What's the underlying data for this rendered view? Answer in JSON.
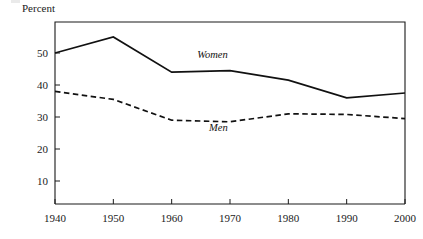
{
  "chart_data": {
    "type": "line",
    "title": "",
    "ylabel": "Percent",
    "xlabel": "",
    "x": [
      1940,
      1950,
      1960,
      1970,
      1980,
      1990,
      2000
    ],
    "xtick_labels": [
      "1940",
      "1950",
      "1960",
      "1970",
      "1980",
      "1990",
      "2000"
    ],
    "ytick_labels": [
      "10",
      "20",
      "30",
      "40",
      "50"
    ],
    "yticks": [
      10,
      20,
      30,
      40,
      50
    ],
    "ylim": [
      0,
      57
    ],
    "xlim": [
      1935,
      2003
    ],
    "grid": false,
    "legend_position": "inline-annotations",
    "series": [
      {
        "name": "Women",
        "style": "solid",
        "color": "#111111",
        "values": [
          50,
          55,
          44,
          44.5,
          41.5,
          36,
          37.5
        ]
      },
      {
        "name": "Men",
        "style": "dashed",
        "color": "#111111",
        "values": [
          38,
          35.5,
          29,
          28.5,
          31,
          30.8,
          29.5
        ]
      }
    ],
    "annotations": [
      {
        "text": "Women",
        "x": 1967,
        "y": 48.5
      },
      {
        "text": "Men",
        "x": 1968,
        "y": 25.5
      }
    ]
  }
}
